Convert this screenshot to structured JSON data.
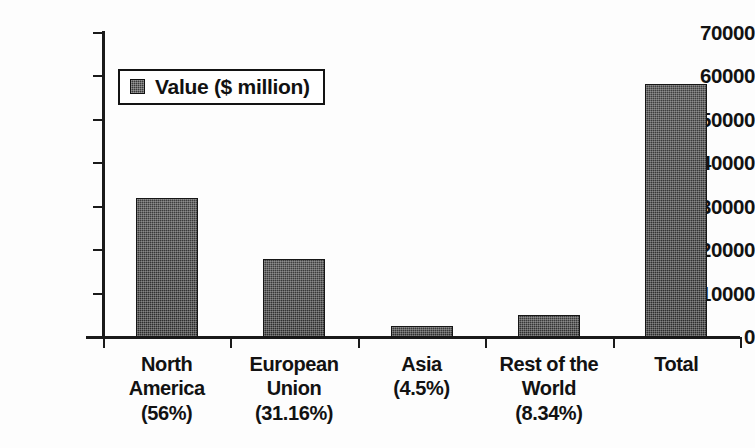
{
  "chart_data": {
    "type": "bar",
    "title": "",
    "subtitle": "",
    "xlabel": "",
    "ylabel": "",
    "ylim": [
      0,
      70000
    ],
    "ytick_step": 10000,
    "yticks": [
      "70000",
      "60000",
      "50000",
      "40000",
      "30000",
      "20000",
      "10000",
      "0"
    ],
    "grid": false,
    "legend": {
      "position": "upper-left-inside",
      "entries": [
        {
          "name": "Value ($ million)",
          "color": "#3a3a3a"
        }
      ]
    },
    "categories": [
      "North America (56%)",
      "European Union (31.16%)",
      "Asia (4.5%)",
      "Rest of the World (8.34%)",
      "Total"
    ],
    "category_lines": [
      [
        "North",
        "America",
        "(56%)"
      ],
      [
        "European",
        "Union",
        "(31.16%)"
      ],
      [
        "Asia",
        "(4.5%)"
      ],
      [
        "Rest of the",
        "World",
        "(8.34%)"
      ],
      [
        "Total"
      ]
    ],
    "series": [
      {
        "name": "Value ($ million)",
        "values": [
          32000,
          18000,
          2500,
          5100,
          58200
        ]
      }
    ],
    "shares_percent": [
      56,
      31.16,
      4.5,
      8.34,
      100
    ]
  },
  "colors": {
    "bar_fill": "#3a3a3a",
    "bar_edge": "#161616",
    "axis": "#1a1a1a",
    "text": "#121212",
    "background": "#ffffff"
  }
}
